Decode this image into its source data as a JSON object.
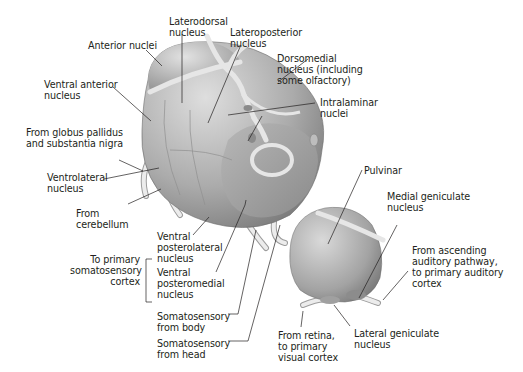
{
  "diagram": {
    "colors": {
      "background": "#ffffff",
      "nucleus_fill_light": "#d4d4d4",
      "nucleus_fill_mid": "#a8a8a8",
      "nucleus_fill_dark": "#7d7d7d",
      "lamina": "#e6e6e6",
      "leader_line": "#231f20",
      "text": "#231f20"
    },
    "labels": {
      "anterior_nuclei": "Anterior nuclei",
      "laterodorsal": "Laterodorsal\nnucleus",
      "lateroposterior": "Lateroposterior\nnucleus",
      "dorsomedial": "Dorsomedial\nnucleus (including\nsome olfactory)",
      "intralaminar": "Intralaminar\nnuclei",
      "ventral_anterior": "Ventral anterior\nnucleus",
      "globus_pallidus": "From globus pallidus\nand substantia nigra",
      "ventrolateral": "Ventrolateral\nnucleus",
      "from_cerebellum": "From\ncerebellum",
      "to_somatosensory": "To primary\nsomatosensory\ncortex",
      "vpl": "Ventral\nposterolateral\nnucleus",
      "vpm": "Ventral\nposteromedial\nnucleus",
      "somato_body": "Somatosensory\nfrom body",
      "somato_head": "Somatosensory\nfrom head",
      "pulvinar": "Pulvinar",
      "medial_geniculate": "Medial geniculate\nnucleus",
      "auditory": "From ascending\nauditory pathway,\nto primary auditory\ncortex",
      "retina": "From retina,\nto primary\nvisual cortex",
      "lateral_geniculate": "Lateral geniculate\nnucleus"
    }
  }
}
